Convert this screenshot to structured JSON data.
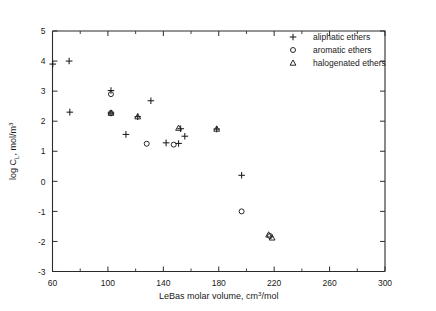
{
  "chart_data": {
    "type": "scatter",
    "title": "",
    "xlabel": "LeBas molar volume, cm3/mol",
    "ylabel": "log CL, mol/m3",
    "xlim": [
      60,
      300
    ],
    "ylim": [
      -3,
      5
    ],
    "xticks": [
      60,
      100,
      140,
      180,
      220,
      260,
      300
    ],
    "xticks_minor": [
      80,
      120,
      160,
      200,
      240,
      280
    ],
    "yticks": [
      -3,
      -2,
      -1,
      0,
      1,
      2,
      3,
      4,
      5
    ],
    "grid": false,
    "legend_position": "top-right",
    "series": [
      {
        "name": "aliphatic ethers",
        "marker": "plus",
        "points": [
          [
            60.2,
            3.9
          ],
          [
            72.0,
            4.0
          ],
          [
            72.5,
            2.3
          ],
          [
            102.2,
            3.02
          ],
          [
            102.2,
            2.27
          ],
          [
            121.5,
            2.15
          ],
          [
            113.0,
            1.56
          ],
          [
            131.0,
            2.68
          ],
          [
            152.5,
            1.75
          ],
          [
            155.5,
            1.5
          ],
          [
            142.0,
            1.28
          ],
          [
            151.0,
            1.26
          ],
          [
            178.5,
            1.74
          ],
          [
            196.5,
            0.2
          ]
        ]
      },
      {
        "name": "aromatic ethers",
        "marker": "circle",
        "points": [
          [
            102.2,
            2.9
          ],
          [
            102.2,
            2.27
          ],
          [
            128.0,
            1.25
          ],
          [
            147.5,
            1.22
          ],
          [
            196.5,
            -1.0
          ],
          [
            217.0,
            -1.82
          ]
        ]
      },
      {
        "name": "halogenated ethers",
        "marker": "triangle",
        "points": [
          [
            102.2,
            2.27
          ],
          [
            121.5,
            2.15
          ],
          [
            151.0,
            1.77
          ],
          [
            178.5,
            1.74
          ],
          [
            216.0,
            -1.78
          ],
          [
            218.5,
            -1.88
          ]
        ]
      }
    ],
    "legend": [
      {
        "marker": "plus",
        "label": "aliphatic ethers"
      },
      {
        "marker": "circle",
        "label": "aromatic ethers"
      },
      {
        "marker": "triangle",
        "label": "halogenated ethers"
      }
    ],
    "ylabel_parts": {
      "pre": "log C",
      "sub": "L",
      "mid": ", mol/m",
      "sup": "3"
    },
    "xlabel_parts": {
      "pre": "LeBas molar volume, cm",
      "sup": "3",
      "post": "/mol"
    }
  }
}
